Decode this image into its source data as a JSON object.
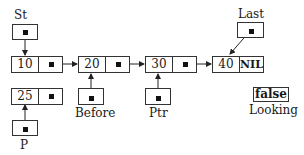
{
  "diagram": {
    "type": "linked-list",
    "pointers": {
      "st": {
        "label": "St"
      },
      "last": {
        "label": "Last"
      },
      "before": {
        "label": "Before"
      },
      "ptr": {
        "label": "Ptr"
      },
      "p": {
        "label": "P"
      }
    },
    "nodes": [
      {
        "value": "10",
        "next": "pointer"
      },
      {
        "value": "20",
        "next": "pointer"
      },
      {
        "value": "30",
        "next": "pointer"
      },
      {
        "value": "40",
        "next": "NIL"
      }
    ],
    "new_node": {
      "value": "25",
      "next": "pointer"
    },
    "looking": {
      "label": "Looking",
      "value": "false"
    }
  }
}
